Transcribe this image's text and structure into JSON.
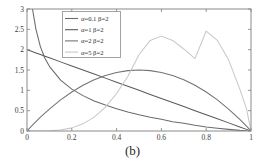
{
  "figure": {
    "caption": "(b)",
    "background_color": "#ffffff",
    "axis_color": "#8a8a8a"
  },
  "chart_data": {
    "type": "line",
    "title": "",
    "xlabel": "",
    "ylabel": "",
    "xlim": [
      0,
      1
    ],
    "ylim": [
      0,
      3
    ],
    "grid": false,
    "legend_position": "top-left-inside",
    "xticks": [
      0,
      0.2,
      0.4,
      0.6,
      0.8,
      1
    ],
    "xtick_labels": [
      "0",
      "0.2",
      "0.4",
      "0.6",
      "0.8",
      "1"
    ],
    "yticks": [
      0,
      0.5,
      1,
      1.5,
      2,
      2.5,
      3
    ],
    "ytick_labels": [
      "0",
      "0.5",
      "1",
      "1.5",
      "2",
      "2.5",
      "3"
    ],
    "x": [
      0.0,
      0.02,
      0.04,
      0.06,
      0.08,
      0.1,
      0.15,
      0.2,
      0.25,
      0.3,
      0.35,
      0.4,
      0.45,
      0.5,
      0.55,
      0.6,
      0.65,
      0.7,
      0.75,
      0.8,
      0.85,
      0.9,
      0.95,
      0.98,
      1.0
    ],
    "series": [
      {
        "name": "α=0.1 β=2",
        "label": "α=0.1 β=2",
        "color": "#6b6b6b",
        "values": [
          8.0,
          3.35,
          2.5,
          2.07,
          1.79,
          1.59,
          1.25,
          1.03,
          0.87,
          0.74,
          0.64,
          0.55,
          0.47,
          0.4,
          0.34,
          0.29,
          0.23,
          0.19,
          0.14,
          0.1,
          0.07,
          0.04,
          0.015,
          0.004,
          0.0
        ]
      },
      {
        "name": "α=1 β=2",
        "label": "α=1 β=2",
        "color": "#5a5a5a",
        "values": [
          2.0,
          1.96,
          1.92,
          1.88,
          1.84,
          1.8,
          1.7,
          1.6,
          1.5,
          1.4,
          1.3,
          1.2,
          1.1,
          1.0,
          0.9,
          0.8,
          0.7,
          0.6,
          0.5,
          0.4,
          0.3,
          0.2,
          0.1,
          0.04,
          0.0
        ]
      },
      {
        "name": "α=2 β=2",
        "label": "α=2 β=2",
        "color": "#747474",
        "values": [
          0.0,
          0.1176,
          0.2304,
          0.3384,
          0.4416,
          0.54,
          0.765,
          0.96,
          1.125,
          1.26,
          1.365,
          1.44,
          1.485,
          1.5,
          1.485,
          1.44,
          1.365,
          1.26,
          1.125,
          0.96,
          0.765,
          0.54,
          0.285,
          0.1176,
          0.0
        ]
      },
      {
        "name": "α=5 β=2",
        "label": "α=5 β=2",
        "color": "#c8c8c8",
        "values": [
          0.0,
          9.4e-06,
          0.00014,
          0.00073,
          0.00226,
          0.0054,
          0.0255,
          0.0768,
          0.1758,
          0.3402,
          0.5887,
          0.9216,
          1.3396,
          1.875,
          2.2269,
          2.3328,
          2.2269,
          2.0172,
          1.7798,
          2.4576,
          2.2269,
          1.7496,
          1.0286,
          0.5421,
          0.0
        ]
      }
    ]
  }
}
